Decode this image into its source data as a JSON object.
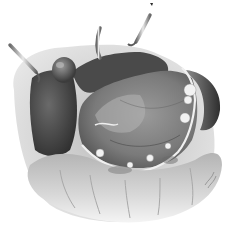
{
  "image": {
    "subject": "Surgical illustration of stomach with retractors",
    "style": "grayscale pencil/wash medical illustration",
    "background": "#ffffff"
  },
  "elements": {
    "retractors": 3,
    "liver_lobe": "left dark region",
    "gallbladder": "round bulge upper-left",
    "stomach": "central opened cavity",
    "omentum_vessels": "white beaded edge along stomach border",
    "spleen": "dark crescent right",
    "colon": "bulging folds along bottom"
  },
  "signature": "illegible artist signature at lower right",
  "colors": {
    "darkest": "#3a3a3a",
    "dark": "#5a5a5a",
    "mid": "#8a8a8a",
    "light": "#c8c8c8",
    "highlight": "#f0f0f0"
  }
}
